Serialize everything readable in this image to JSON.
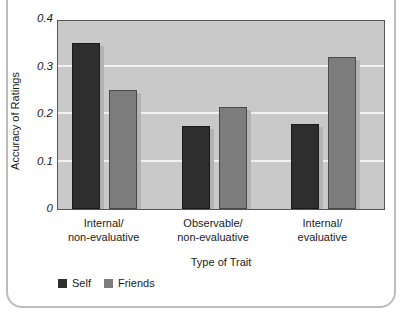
{
  "card": {
    "clipped_caption": ""
  },
  "chart_data": {
    "type": "bar",
    "title": "",
    "xlabel": "Type of Trait",
    "ylabel": "Accuracy of Ratings",
    "categories": [
      "Internal/\nnon-evaluative",
      "Observable/\nnon-evaluative",
      "Internal/\nevaluative"
    ],
    "category_lines": [
      [
        "Internal/",
        "non-evaluative"
      ],
      [
        "Observable/",
        "non-evaluative"
      ],
      [
        "Internal/",
        "evaluative"
      ]
    ],
    "series": [
      {
        "name": "Self",
        "color": "#2e2e2e",
        "values": [
          0.35,
          0.175,
          0.178
        ]
      },
      {
        "name": "Friends",
        "color": "#7c7c7c",
        "values": [
          0.25,
          0.215,
          0.32
        ]
      }
    ],
    "ylim": [
      0,
      0.4
    ],
    "yticks": [
      0,
      0.1,
      0.2,
      0.3,
      0.4
    ],
    "ytick_labels": [
      "0",
      "0.1",
      "0.2",
      "0.3",
      "0.4"
    ],
    "gridlines": [
      0.1,
      0.2,
      0.3
    ],
    "grid": true,
    "legend_position": "bottom-left",
    "plot_background": "#c9c9c9",
    "axis_color": "#555555"
  }
}
